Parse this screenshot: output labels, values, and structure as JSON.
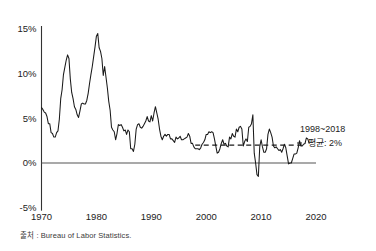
{
  "source_note": "출처 : Bureau of Labor Statistics.",
  "annotation": {
    "line1": "1998~2018",
    "line2": "평균: 2%"
  },
  "chart_data": {
    "type": "line",
    "title": "",
    "subtitle": "",
    "xlabel": "",
    "ylabel": "",
    "xlim": [
      1970,
      2020
    ],
    "ylim": [
      -5,
      15
    ],
    "grid": false,
    "legend_position": "right-inline",
    "x_tick_labels": [
      "1970",
      "1980",
      "1990",
      "2000",
      "2010",
      "2020"
    ],
    "x_ticks": [
      1970,
      1980,
      1990,
      2000,
      2010,
      2020
    ],
    "y_tick_labels": [
      "15%",
      "10%",
      "5%",
      "0%",
      "-5%"
    ],
    "y_ticks": [
      15,
      10,
      5,
      0,
      -5
    ],
    "series": [
      {
        "name": "US CPI inflation rate (year-over-year, %)",
        "x": [
          1970.0,
          1970.25,
          1970.5,
          1970.75,
          1971.0,
          1971.25,
          1971.5,
          1971.75,
          1972.0,
          1972.25,
          1972.5,
          1972.75,
          1973.0,
          1973.25,
          1973.5,
          1973.75,
          1974.0,
          1974.25,
          1974.5,
          1974.75,
          1975.0,
          1975.25,
          1975.5,
          1975.75,
          1976.0,
          1976.25,
          1976.5,
          1976.75,
          1977.0,
          1977.25,
          1977.5,
          1977.75,
          1978.0,
          1978.25,
          1978.5,
          1978.75,
          1979.0,
          1979.25,
          1979.5,
          1979.75,
          1980.0,
          1980.25,
          1980.5,
          1980.75,
          1981.0,
          1981.25,
          1981.5,
          1981.75,
          1982.0,
          1982.25,
          1982.5,
          1982.75,
          1983.0,
          1983.25,
          1983.5,
          1983.75,
          1984.0,
          1984.25,
          1984.5,
          1984.75,
          1985.0,
          1985.25,
          1985.5,
          1985.75,
          1986.0,
          1986.25,
          1986.5,
          1986.75,
          1987.0,
          1987.25,
          1987.5,
          1987.75,
          1988.0,
          1988.25,
          1988.5,
          1988.75,
          1989.0,
          1989.25,
          1989.5,
          1989.75,
          1990.0,
          1990.25,
          1990.5,
          1990.75,
          1991.0,
          1991.25,
          1991.5,
          1991.75,
          1992.0,
          1992.25,
          1992.5,
          1992.75,
          1993.0,
          1993.25,
          1993.5,
          1993.75,
          1994.0,
          1994.25,
          1994.5,
          1994.75,
          1995.0,
          1995.25,
          1995.5,
          1995.75,
          1996.0,
          1996.25,
          1996.5,
          1996.75,
          1997.0,
          1997.25,
          1997.5,
          1997.75,
          1998.0,
          1998.25,
          1998.5,
          1998.75,
          1999.0,
          1999.25,
          1999.5,
          1999.75,
          2000.0,
          2000.25,
          2000.5,
          2000.75,
          2001.0,
          2001.25,
          2001.5,
          2001.75,
          2002.0,
          2002.25,
          2002.5,
          2002.75,
          2003.0,
          2003.25,
          2003.5,
          2003.75,
          2004.0,
          2004.25,
          2004.5,
          2004.75,
          2005.0,
          2005.25,
          2005.5,
          2005.75,
          2006.0,
          2006.25,
          2006.5,
          2006.75,
          2007.0,
          2007.25,
          2007.5,
          2007.75,
          2008.0,
          2008.25,
          2008.5,
          2008.75,
          2009.0,
          2009.25,
          2009.5,
          2009.75,
          2010.0,
          2010.25,
          2010.5,
          2010.75,
          2011.0,
          2011.25,
          2011.5,
          2011.75,
          2012.0,
          2012.25,
          2012.5,
          2012.75,
          2013.0,
          2013.25,
          2013.5,
          2013.75,
          2014.0,
          2014.25,
          2014.5,
          2014.75,
          2015.0,
          2015.25,
          2015.5,
          2015.75,
          2016.0,
          2016.25,
          2016.5,
          2016.75,
          2017.0,
          2017.25,
          2017.5,
          2017.75,
          2018.0,
          2018.25,
          2018.5,
          2018.75
        ],
        "values": [
          6.2,
          6.0,
          5.7,
          5.6,
          5.2,
          4.4,
          4.4,
          3.4,
          3.3,
          2.9,
          2.9,
          3.4,
          3.6,
          4.9,
          7.2,
          8.2,
          9.9,
          10.7,
          11.5,
          12.1,
          11.7,
          9.4,
          7.9,
          7.2,
          6.3,
          6.0,
          5.4,
          5.1,
          5.8,
          6.6,
          6.7,
          6.6,
          6.6,
          7.0,
          7.8,
          8.9,
          9.9,
          10.8,
          11.9,
          13.0,
          14.2,
          14.5,
          12.9,
          12.5,
          11.7,
          9.8,
          10.8,
          9.6,
          8.4,
          6.9,
          5.9,
          4.0,
          3.7,
          3.5,
          2.6,
          3.3,
          4.3,
          4.2,
          4.3,
          4.0,
          3.6,
          3.7,
          3.2,
          3.7,
          3.5,
          1.6,
          1.6,
          1.3,
          2.1,
          3.8,
          4.3,
          4.4,
          4.0,
          3.9,
          4.1,
          4.4,
          4.7,
          5.2,
          4.7,
          4.6,
          5.3,
          4.7,
          5.6,
          6.3,
          5.6,
          4.9,
          3.8,
          3.0,
          2.6,
          3.0,
          3.2,
          3.0,
          3.2,
          3.2,
          2.7,
          2.7,
          2.5,
          2.3,
          2.9,
          2.7,
          2.8,
          3.0,
          2.6,
          2.6,
          2.7,
          2.8,
          2.9,
          3.3,
          3.0,
          2.2,
          2.2,
          1.8,
          1.6,
          1.6,
          1.6,
          1.5,
          1.7,
          2.1,
          2.3,
          2.6,
          3.2,
          3.2,
          3.5,
          3.4,
          3.5,
          3.4,
          2.7,
          1.9,
          1.1,
          1.2,
          1.6,
          2.2,
          2.6,
          2.1,
          2.2,
          1.9,
          1.8,
          2.9,
          2.7,
          3.3,
          3.0,
          2.9,
          3.8,
          3.5,
          4.0,
          4.1,
          3.8,
          1.9,
          2.4,
          2.7,
          2.4,
          4.0,
          4.1,
          4.4,
          5.4,
          1.1,
          0.0,
          -1.3,
          -1.5,
          1.8,
          2.6,
          1.8,
          1.2,
          1.2,
          1.6,
          3.2,
          3.8,
          3.4,
          2.9,
          1.9,
          1.7,
          1.8,
          1.6,
          1.4,
          1.5,
          1.2,
          1.6,
          2.1,
          1.7,
          0.8,
          -0.1,
          0.0,
          0.0,
          0.5,
          1.0,
          1.0,
          1.1,
          1.7,
          2.5,
          1.9,
          1.9,
          2.1,
          2.2,
          2.8,
          2.7,
          2.2
        ]
      }
    ],
    "reference_line": {
      "label": "1998~2018 평균: 2%",
      "value": 2,
      "x_start": 1998,
      "x_end": 2018,
      "style": "dashed"
    }
  }
}
